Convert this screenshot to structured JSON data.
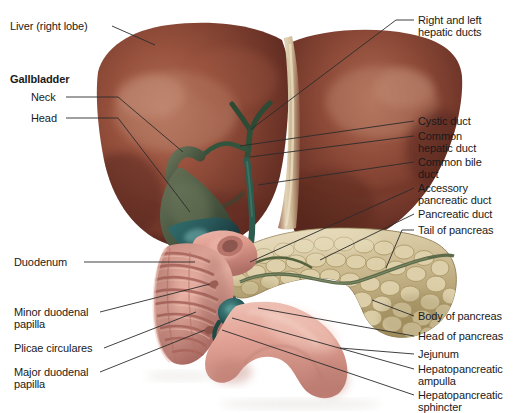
{
  "figure": {
    "background_color": "#ffffff",
    "width": 513,
    "height": 413,
    "leader_line_color": "#2b2b2b",
    "label_text_color": "#1a1a1a"
  },
  "palette": {
    "liver_base": "#8a4636",
    "liver_dark": "#5e2a20",
    "liver_highlight": "#b3705a",
    "falciform_ligament": "#d9c9a8",
    "gallbladder": "#53604a",
    "gallbladder_dark": "#2f3a2c",
    "gallbladder_teal": "#2f6a6b",
    "bile_duct": "#3c5a45",
    "pancreas_base": "#cdbb92",
    "pancreas_light": "#e4d8b8",
    "pancreas_dark": "#a8966e",
    "pancreatic_duct": "#5d6b4a",
    "duodenum": "#e0a095",
    "duodenum_dark": "#b5736a",
    "duodenum_fold": "#c4857a",
    "jejunum": "#e6a89c"
  },
  "labels_left": [
    {
      "id": "liver-right-lobe",
      "name": "liver-right-lobe-label",
      "text": "Liver (right lobe)",
      "bold": false,
      "x": 10,
      "y": 20,
      "leader": [
        [
          112,
          26
        ],
        [
          155,
          45
        ]
      ]
    },
    {
      "id": "gallbladder-heading",
      "name": "gallbladder-heading-label",
      "text": "Gallbladder",
      "bold": true,
      "x": 10,
      "y": 73,
      "leader": null
    },
    {
      "id": "gallbladder-neck",
      "name": "gallbladder-neck-label",
      "text": "Neck",
      "bold": false,
      "x": 31,
      "y": 91,
      "leader": [
        [
          66,
          97
        ],
        [
          118,
          97
        ],
        [
          183,
          152
        ]
      ]
    },
    {
      "id": "gallbladder-head",
      "name": "gallbladder-head-label",
      "text": "Head",
      "bold": false,
      "x": 31,
      "y": 112,
      "leader": [
        [
          66,
          118
        ],
        [
          118,
          118
        ],
        [
          190,
          212
        ]
      ]
    },
    {
      "id": "duodenum",
      "name": "duodenum-label",
      "text": "Duodenum",
      "bold": false,
      "x": 14,
      "y": 256,
      "leader": [
        [
          84,
          262
        ],
        [
          195,
          262
        ]
      ]
    },
    {
      "id": "minor-duodenal-papilla",
      "name": "minor-duodenal-papilla-label",
      "text": "Minor duodenal\npapilla",
      "bold": false,
      "x": 14,
      "y": 306,
      "leader": [
        [
          100,
          312
        ],
        [
          210,
          284
        ]
      ]
    },
    {
      "id": "plicae-circulares",
      "name": "plicae-circulares-label",
      "text": "Plicae circulares",
      "bold": false,
      "x": 14,
      "y": 342,
      "leader": [
        [
          104,
          348
        ],
        [
          196,
          312
        ]
      ]
    },
    {
      "id": "major-duodenal-papilla",
      "name": "major-duodenal-papilla-label",
      "text": "Major duodenal\npapilla",
      "bold": false,
      "x": 14,
      "y": 366,
      "leader": [
        [
          100,
          372
        ],
        [
          205,
          330
        ]
      ]
    }
  ],
  "labels_right": [
    {
      "id": "right-and-left-hepatic-ducts",
      "name": "right-and-left-hepatic-ducts-label",
      "text": "Right and left\nhepatic ducts",
      "bold": false,
      "x": 418,
      "y": 14,
      "leader": [
        [
          414,
          20
        ],
        [
          396,
          20
        ],
        [
          250,
          130
        ]
      ]
    },
    {
      "id": "cystic-duct",
      "name": "cystic-duct-label",
      "text": "Cystic duct",
      "bold": false,
      "x": 418,
      "y": 115,
      "leader": [
        [
          414,
          121
        ],
        [
          240,
          146
        ]
      ]
    },
    {
      "id": "common-hepatic-duct",
      "name": "common-hepatic-duct-label",
      "text": "Common\nhepatic duct",
      "bold": false,
      "x": 418,
      "y": 130,
      "leader": [
        [
          414,
          136
        ],
        [
          250,
          157
        ]
      ]
    },
    {
      "id": "common-bile-duct",
      "name": "common-bile-duct-label",
      "text": "Common bile\nduct",
      "bold": false,
      "x": 418,
      "y": 156,
      "leader": [
        [
          414,
          162
        ],
        [
          258,
          185
        ]
      ]
    },
    {
      "id": "accessory-pancreatic-duct",
      "name": "accessory-pancreatic-duct-label",
      "text": "Accessory\npancreatic duct",
      "bold": false,
      "x": 418,
      "y": 182,
      "leader": [
        [
          414,
          188
        ],
        [
          250,
          262
        ]
      ]
    },
    {
      "id": "pancreatic-duct",
      "name": "pancreatic-duct-label",
      "text": "Pancreatic duct",
      "bold": false,
      "x": 418,
      "y": 208,
      "leader": [
        [
          414,
          214
        ],
        [
          320,
          260
        ]
      ]
    },
    {
      "id": "tail-of-pancreas",
      "name": "tail-of-pancreas-label",
      "text": "Tail of pancreas",
      "bold": false,
      "x": 418,
      "y": 224,
      "leader": [
        [
          414,
          230
        ],
        [
          402,
          230
        ],
        [
          386,
          268
        ]
      ]
    },
    {
      "id": "body-of-pancreas",
      "name": "body-of-pancreas-label",
      "text": "Body of pancreas",
      "bold": false,
      "x": 418,
      "y": 310,
      "leader": [
        [
          414,
          316
        ],
        [
          372,
          300
        ]
      ]
    },
    {
      "id": "head-of-pancreas",
      "name": "head-of-pancreas-label",
      "text": "Head of pancreas",
      "bold": false,
      "x": 418,
      "y": 330,
      "leader": [
        [
          414,
          336
        ],
        [
          258,
          308
        ]
      ]
    },
    {
      "id": "jejunum",
      "name": "jejunum-label",
      "text": "Jejunum",
      "bold": false,
      "x": 418,
      "y": 348,
      "leader": [
        [
          414,
          354
        ],
        [
          340,
          348
        ]
      ]
    },
    {
      "id": "hepatopancreatic-ampulla",
      "name": "hepatopancreatic-ampulla-label",
      "text": "Hepatopancreatic\nampulla",
      "bold": false,
      "x": 418,
      "y": 363,
      "leader": [
        [
          414,
          369
        ],
        [
          232,
          318
        ]
      ]
    },
    {
      "id": "hepatopancreatic-sphincter",
      "name": "hepatopancreatic-sphincter-label",
      "text": "Hepatopancreatic\nsphincter",
      "bold": false,
      "x": 418,
      "y": 389,
      "leader": [
        [
          414,
          395
        ],
        [
          222,
          330
        ]
      ]
    }
  ],
  "structures": [
    {
      "name": "liver-right-lobe",
      "label": "Liver (right lobe)"
    },
    {
      "name": "liver-left-lobe",
      "label": "Liver (left lobe)"
    },
    {
      "name": "falciform-ligament",
      "label": "Falciform ligament"
    },
    {
      "name": "gallbladder",
      "label": "Gallbladder"
    },
    {
      "name": "cystic-duct",
      "label": "Cystic duct"
    },
    {
      "name": "common-hepatic-duct",
      "label": "Common hepatic duct"
    },
    {
      "name": "common-bile-duct",
      "label": "Common bile duct"
    },
    {
      "name": "pancreas",
      "label": "Pancreas"
    },
    {
      "name": "pancreatic-duct",
      "label": "Pancreatic duct"
    },
    {
      "name": "duodenum",
      "label": "Duodenum"
    },
    {
      "name": "jejunum",
      "label": "Jejunum"
    }
  ]
}
